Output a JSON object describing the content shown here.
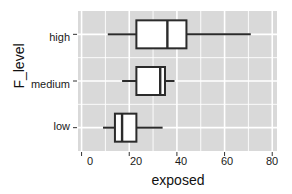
{
  "chart_data": {
    "type": "boxplot",
    "title": "",
    "xlabel": "exposed",
    "ylabel": "F_level",
    "orientation": "horizontal",
    "xlim": [
      -1.5,
      82
    ],
    "xticks": [
      0,
      20,
      40,
      60,
      80
    ],
    "xtick_labels": [
      "0",
      "20",
      "40",
      "60",
      "80"
    ],
    "xminor_ticks": [
      10,
      30,
      50,
      70
    ],
    "grid": true,
    "grid_color": "#ffffff",
    "panel_bg": "#d9d9d9",
    "box_fill": "#ffffff",
    "box_line_color": "#2b2b2b",
    "categories": [
      "high",
      "medium",
      "low"
    ],
    "boxes": [
      {
        "category": "high",
        "whisker_low": 11,
        "q1": 23,
        "median": 36,
        "q3": 44,
        "whisker_high": 71
      },
      {
        "category": "medium",
        "whisker_low": 17,
        "q1": 23,
        "median": 33,
        "q3": 35,
        "whisker_high": 39
      },
      {
        "category": "low",
        "whisker_low": 9,
        "q1": 14,
        "median": 17,
        "q3": 23,
        "whisker_high": 34
      }
    ]
  },
  "axes": {
    "x_title": "exposed",
    "y_title": "F_level",
    "y_tick_labels": [
      "high",
      "medium",
      "low"
    ],
    "x_tick_labels": [
      "0",
      "20",
      "40",
      "60",
      "80"
    ]
  }
}
